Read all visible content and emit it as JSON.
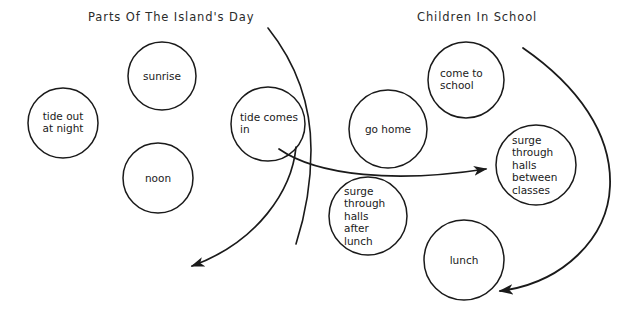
{
  "diagram": {
    "type": "venn-like-circles-with-arrows",
    "background_color": "#ffffff",
    "stroke_color": "#1a1a1a",
    "headings": [
      {
        "id": "left",
        "text": "Parts Of The Island's Day"
      },
      {
        "id": "right",
        "text": "Children In School"
      }
    ],
    "circles": [
      {
        "id": "tide-out-at-night",
        "text": "tide out\nat night",
        "cx": 63,
        "cy": 123,
        "r": 35,
        "align": "center"
      },
      {
        "id": "sunrise",
        "text": "sunrise",
        "cx": 162,
        "cy": 76,
        "r": 34,
        "align": "center"
      },
      {
        "id": "noon",
        "text": "noon",
        "cx": 158,
        "cy": 178,
        "r": 35,
        "align": "center"
      },
      {
        "id": "tide-comes-in",
        "text": "tide comes\nin",
        "cx": 268,
        "cy": 124,
        "r": 37,
        "align": "left"
      },
      {
        "id": "go-home",
        "text": "go  home",
        "cx": 388,
        "cy": 129,
        "r": 39,
        "align": "center"
      },
      {
        "id": "come-to-school",
        "text": "come  to\nschool",
        "cx": 466,
        "cy": 80,
        "r": 38,
        "align": "left"
      },
      {
        "id": "surge-between-classes",
        "text": "surge\nthrough\nhalls\nbetween\nclasses",
        "cx": 536,
        "cy": 165,
        "r": 40,
        "align": "left"
      },
      {
        "id": "surge-after-lunch",
        "text": "surge\nthrough\nhalls\nafter\nlunch",
        "cx": 368,
        "cy": 216,
        "r": 39,
        "align": "left"
      },
      {
        "id": "lunch",
        "text": "lunch",
        "cx": 464,
        "cy": 260,
        "r": 40,
        "align": "center"
      }
    ],
    "arrows": [
      {
        "id": "arrow-down-left",
        "from": "tide-comes-in",
        "to": "bottom-left-open"
      },
      {
        "id": "arrow-to-classes",
        "from": "tide-comes-in",
        "to": "surge-between-classes"
      },
      {
        "id": "arrow-right-loop",
        "from": "come-to-school",
        "to": "lunch"
      }
    ],
    "unclosed_curves": [
      {
        "id": "long-divider-curve",
        "note": "arc sweeping from top center down past tide comes in"
      }
    ]
  }
}
